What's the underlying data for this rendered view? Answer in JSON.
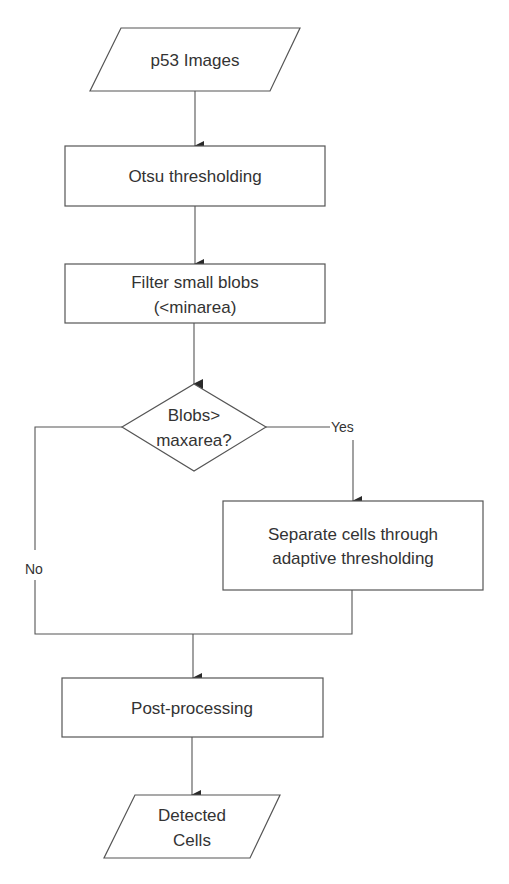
{
  "diagram": {
    "type": "flowchart",
    "nodes": {
      "input": {
        "shape": "parallelogram",
        "label": "p53 Images"
      },
      "otsu": {
        "shape": "rectangle",
        "label": "Otsu thresholding"
      },
      "filter": {
        "shape": "rectangle",
        "label_line1": "Filter small blobs",
        "label_line2": "(<minarea)"
      },
      "decision": {
        "shape": "diamond",
        "label_line1": "Blobs>",
        "label_line2": "maxarea?"
      },
      "separate": {
        "shape": "rectangle",
        "label_line1": "Separate cells through",
        "label_line2": "adaptive thresholding"
      },
      "post": {
        "shape": "rectangle",
        "label": "Post-processing"
      },
      "output": {
        "shape": "parallelogram",
        "label_line1": "Detected",
        "label_line2": "Cells"
      }
    },
    "edges": {
      "yes_label": "Yes",
      "no_label": "No"
    },
    "edge_list": [
      {
        "from": "input",
        "to": "otsu"
      },
      {
        "from": "otsu",
        "to": "filter"
      },
      {
        "from": "filter",
        "to": "decision"
      },
      {
        "from": "decision",
        "to": "separate",
        "label": "Yes"
      },
      {
        "from": "decision",
        "to": "post",
        "label": "No"
      },
      {
        "from": "separate",
        "to": "post"
      },
      {
        "from": "post",
        "to": "output"
      }
    ],
    "colors": {
      "stroke": "#555555",
      "text": "#333333",
      "background": "#ffffff"
    }
  }
}
